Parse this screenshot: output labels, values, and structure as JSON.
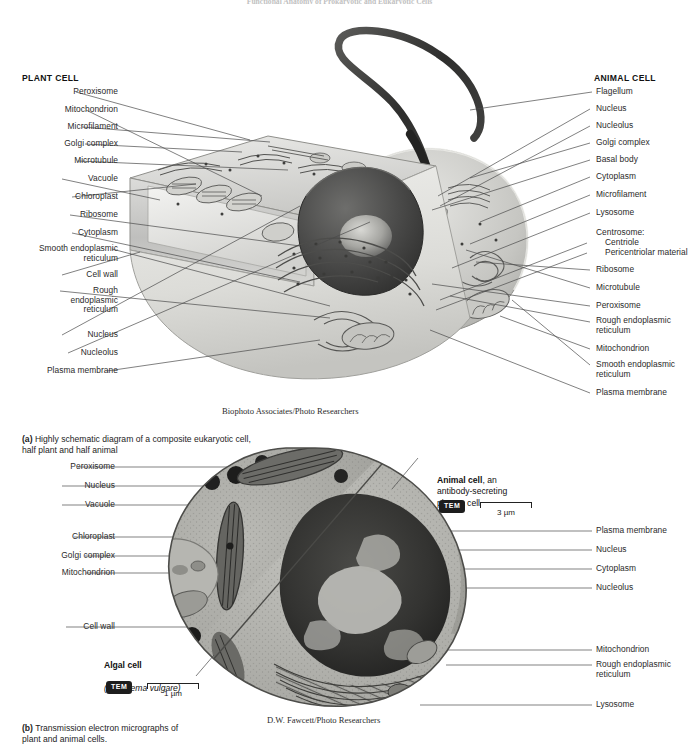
{
  "page": {
    "running_head": "Functional Anatomy of Prokaryotic and Eukaryotic Cells",
    "background": "#ffffff",
    "leader_color": "#4a4a4a"
  },
  "panel_a": {
    "plant_heading": "PLANT CELL",
    "animal_heading": "ANIMAL CELL",
    "credit": "Biophoto Associates/Photo Researchers",
    "caption_marker": "(a)",
    "caption_text": " Highly schematic diagram of a composite eukaryotic cell,\nhalf plant and half animal",
    "left_labels": [
      {
        "text": "Peroxisome",
        "y": 93,
        "lines": 1
      },
      {
        "text": "Mitochondrion",
        "y": 111,
        "lines": 1
      },
      {
        "text": "Microfilament",
        "y": 128,
        "lines": 1
      },
      {
        "text": "Golgi complex",
        "y": 145,
        "lines": 1
      },
      {
        "text": "Microtubule",
        "y": 162,
        "lines": 1
      },
      {
        "text": "Vacuole",
        "y": 180,
        "lines": 1
      },
      {
        "text": "Chloroplast",
        "y": 198,
        "lines": 1
      },
      {
        "text": "Ribosome",
        "y": 216,
        "lines": 1
      },
      {
        "text": "Cytoplasm",
        "y": 234,
        "lines": 1
      },
      {
        "text": "Smooth endoplasmic\nreticulum",
        "y": 250,
        "lines": 2
      },
      {
        "text": "Cell wall",
        "y": 276,
        "lines": 1
      },
      {
        "text": "Rough\nendoplasmic\nreticulum",
        "y": 292,
        "lines": 3
      },
      {
        "text": "Nucleus",
        "y": 336,
        "lines": 1
      },
      {
        "text": "Nucleolus",
        "y": 354,
        "lines": 1
      },
      {
        "text": "Plasma membrane",
        "y": 372,
        "lines": 1
      }
    ],
    "right_labels": [
      {
        "text": "Flagellum",
        "y": 93,
        "lines": 1
      },
      {
        "text": "Nucleus",
        "y": 110,
        "lines": 1
      },
      {
        "text": "Nucleolus",
        "y": 127,
        "lines": 1
      },
      {
        "text": "Golgi complex",
        "y": 144,
        "lines": 1
      },
      {
        "text": "Basal body",
        "y": 161,
        "lines": 1
      },
      {
        "text": "Cytoplasm",
        "y": 178,
        "lines": 1
      },
      {
        "text": "Microfilament",
        "y": 196,
        "lines": 1
      },
      {
        "text": "Lysosome",
        "y": 214,
        "lines": 1
      },
      {
        "text": "Centrosome:",
        "y": 234,
        "lines": 1,
        "no_leader": true
      },
      {
        "text": "Centriole",
        "y": 244,
        "lines": 1,
        "indent": 9
      },
      {
        "text": "Pericentriolar material",
        "y": 254,
        "lines": 1,
        "indent": 9
      },
      {
        "text": "Ribosome",
        "y": 271,
        "lines": 1
      },
      {
        "text": "Microtubule",
        "y": 289,
        "lines": 1
      },
      {
        "text": "Peroxisome",
        "y": 307,
        "lines": 1
      },
      {
        "text": "Rough endoplasmic\nreticulum",
        "y": 322,
        "lines": 2
      },
      {
        "text": "Mitochondrion",
        "y": 350,
        "lines": 1
      },
      {
        "text": "Smooth endoplasmic\nreticulum",
        "y": 366,
        "lines": 2
      },
      {
        "text": "Plasma membrane",
        "y": 394,
        "lines": 1
      }
    ]
  },
  "panel_b": {
    "credit": "D.W. Fawcett/Photo Researchers",
    "caption_marker": "(b)",
    "caption_text": " Transmission electron micrographs of\nplant and animal cells.",
    "left_labels": [
      {
        "text": "Peroxisome",
        "y": 468
      },
      {
        "text": "Nucleus",
        "y": 487
      },
      {
        "text": "Vacuole",
        "y": 506
      },
      {
        "text": "Chloroplast",
        "y": 538
      },
      {
        "text": "Golgi complex",
        "y": 557
      },
      {
        "text": "Mitochondrion",
        "y": 574
      },
      {
        "text": "Cell wall",
        "y": 628
      }
    ],
    "right_labels": [
      {
        "text": "Plasma membrane",
        "y": 532,
        "lines": 1
      },
      {
        "text": "Nucleus",
        "y": 551,
        "lines": 1
      },
      {
        "text": "Cytoplasm",
        "y": 570,
        "lines": 1
      },
      {
        "text": "Nucleolus",
        "y": 589,
        "lines": 1
      },
      {
        "text": "Mitochondrion",
        "y": 651,
        "lines": 1
      },
      {
        "text": "Rough endoplasmic\nreticulum",
        "y": 666,
        "lines": 2
      },
      {
        "text": "Lysosome",
        "y": 706,
        "lines": 1
      }
    ],
    "animal_note": {
      "title": "Animal cell",
      "rest": ", an\nantibody-secreting\nplasma cell",
      "tem_label": "TEM",
      "scale_text": "3 µm"
    },
    "algal_note": {
      "title": "Algal cell",
      "species": "(Tribonema vulgare)",
      "tem_label": "TEM",
      "scale_text": "1 µm"
    }
  }
}
